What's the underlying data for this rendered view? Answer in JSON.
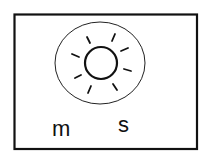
{
  "diagram": {
    "labels": {
      "left": "m",
      "right": "s"
    },
    "icon": "sun-icon",
    "colors": {
      "stroke": "#111111",
      "background": "#ffffff"
    },
    "ray_count": 8
  }
}
